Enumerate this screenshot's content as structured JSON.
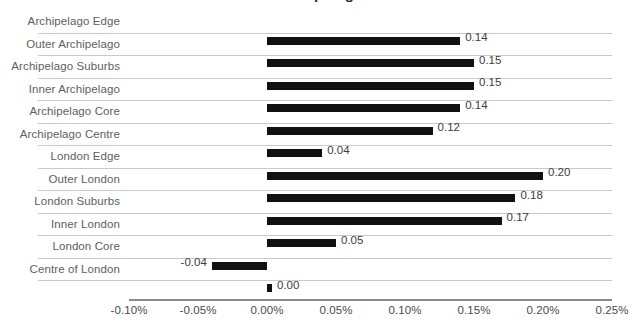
{
  "chart_data": {
    "type": "bar",
    "orientation": "horizontal",
    "title": "Archipelago",
    "categories": [
      "Archipelago Edge",
      "Outer Archipelago",
      "Archipelago Suburbs",
      "Inner Archipelago",
      "Archipelago Core",
      "Archipelago Centre",
      "London Edge",
      "Outer London",
      "London Suburbs",
      "Inner London",
      "London Core",
      "Centre of London"
    ],
    "values": [
      0.14,
      0.15,
      0.15,
      0.14,
      0.12,
      0.04,
      0.2,
      0.18,
      0.17,
      0.05,
      -0.04,
      0.0
    ],
    "data_labels": [
      "0.14",
      "0.15",
      "0.15",
      "0.14",
      "0.12",
      "0.04",
      "0.20",
      "0.18",
      "0.17",
      "0.05",
      "-0.04",
      "0.00"
    ],
    "xlabel": "",
    "ylabel": "",
    "xlim": [
      -0.1,
      0.25
    ],
    "xticks": [
      -0.1,
      -0.05,
      0.0,
      0.05,
      0.1,
      0.15,
      0.2,
      0.25
    ],
    "xtick_labels": [
      "-0.10%",
      "-0.05%",
      "0.00%",
      "0.05%",
      "0.10%",
      "0.15%",
      "0.20%",
      "0.25%"
    ],
    "grid": "horizontal",
    "legend": null,
    "bar_color": "#111111",
    "gridline_color": "#c9c9c9",
    "axis_color": "#8a8a8a",
    "label_color": "#5e5e5e",
    "value_unit": "%"
  }
}
